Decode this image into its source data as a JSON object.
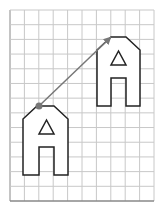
{
  "diagram": {
    "type": "translation-on-grid",
    "grid": {
      "x0": 10,
      "y0": 10,
      "x1": 154,
      "y1": 201,
      "cell": 14.4,
      "cols": 10,
      "rows": 13,
      "line_color": "#c8c8c8",
      "border_color": "#888888"
    },
    "shapes": [
      {
        "name": "original-house-shape",
        "outline": [
          [
            23,
            119
          ],
          [
            37,
            106
          ],
          [
            54,
            106
          ],
          [
            68,
            119
          ],
          [
            68,
            175
          ],
          [
            54,
            175
          ],
          [
            54,
            147
          ],
          [
            39,
            147
          ],
          [
            39,
            175
          ],
          [
            23,
            175
          ]
        ],
        "triangle": [
          [
            46.5,
            120
          ],
          [
            39,
            134
          ],
          [
            54,
            134
          ]
        ]
      },
      {
        "name": "translated-house-shape",
        "outline": [
          [
            97,
            50
          ],
          [
            111,
            37
          ],
          [
            126,
            37
          ],
          [
            140,
            50
          ],
          [
            140,
            106
          ],
          [
            126,
            106
          ],
          [
            126,
            78
          ],
          [
            111,
            78
          ],
          [
            111,
            106
          ],
          [
            97,
            106
          ]
        ],
        "triangle": [
          [
            118.5,
            51
          ],
          [
            111,
            65
          ],
          [
            126,
            65
          ]
        ]
      }
    ],
    "translation_arrow": {
      "from": [
        39,
        106
      ],
      "to": [
        110,
        38
      ],
      "color": "#777777"
    },
    "point": {
      "x": 39,
      "y": 106,
      "color": "#777777"
    },
    "stroke_color": "#222222"
  }
}
